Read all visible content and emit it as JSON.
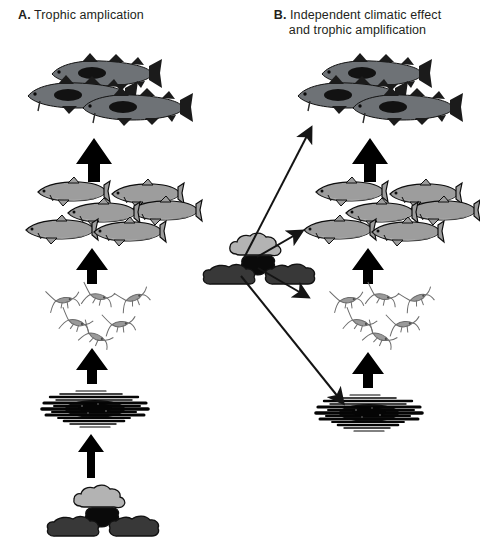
{
  "figure": {
    "background_color": "#ffffff",
    "width": 473,
    "height": 544
  },
  "panels": [
    {
      "id": "A",
      "tag": "A.",
      "title": "Trophic amplication",
      "title_line2": ""
    },
    {
      "id": "B",
      "tag": "B.",
      "title": "Independent climatic effect",
      "title_line2": "and trophic amplification"
    }
  ],
  "nodes": {
    "cod": {
      "label": "cod",
      "count": 3,
      "body_color": "#6e7276",
      "fin_color": "#1b1b1b",
      "patch_color": "#121212",
      "outline_color": "#111111"
    },
    "herring": {
      "label": "herring",
      "count": 6,
      "body_color": "#9d9d9d",
      "belly_color": "#cfcfcf",
      "outline_color": "#0d0d0d"
    },
    "copepods": {
      "label": "copepods",
      "count": 6,
      "body_color": "#9a9a9a",
      "outline_color": "#6d6d6d"
    },
    "phytoplankton": {
      "label": "phytoplankton",
      "color": "#050505"
    },
    "climate": {
      "label": "climate",
      "upper_cloud_color": "#b3b3b3",
      "center_cloud_color": "#0a0a0a",
      "lower_cloud_color": "#383838",
      "outline_color": "#111111"
    }
  },
  "arrows": {
    "trophic": {
      "label": "trophic link",
      "style": "thick-block",
      "color": "#000000"
    },
    "climatic": {
      "label": "direct climatic effect",
      "style": "thin-line",
      "color": "#141414"
    }
  },
  "panel_a": {
    "trophic_arrows": [
      {
        "from": "climate",
        "to": "phytoplankton"
      },
      {
        "from": "phytoplankton",
        "to": "copepods"
      },
      {
        "from": "copepods",
        "to": "herring"
      },
      {
        "from": "herring",
        "to": "cod"
      }
    ],
    "climatic_arrows": []
  },
  "panel_b": {
    "trophic_arrows": [
      {
        "from": "phytoplankton",
        "to": "copepods"
      },
      {
        "from": "copepods",
        "to": "herring"
      },
      {
        "from": "herring",
        "to": "cod"
      }
    ],
    "climatic_arrows": [
      {
        "from": "climate",
        "to": "cod"
      },
      {
        "from": "climate",
        "to": "herring"
      },
      {
        "from": "climate",
        "to": "copepods"
      },
      {
        "from": "climate",
        "to": "phytoplankton"
      }
    ]
  },
  "caption": {
    "text": ""
  }
}
